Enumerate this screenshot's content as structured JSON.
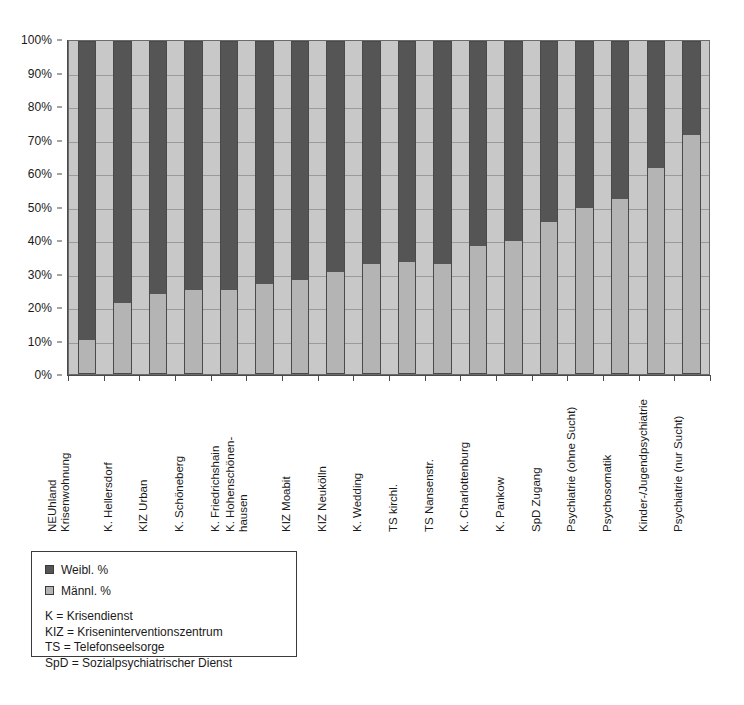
{
  "chart_data": {
    "type": "bar",
    "subtype": "stacked-percent",
    "title": "",
    "xlabel": "",
    "ylabel": "",
    "ylim": [
      0,
      100
    ],
    "grid": true,
    "legend_position": "below-left",
    "y_ticks": [
      "0%",
      "10%",
      "20%",
      "30%",
      "40%",
      "50%",
      "60%",
      "70%",
      "80%",
      "90%",
      "100%"
    ],
    "y_tick_values": [
      0,
      10,
      20,
      30,
      40,
      50,
      60,
      70,
      80,
      90,
      100
    ],
    "categories": [
      "NEUhland Krisenwohnung",
      "K. Hellersdorf",
      "KIZ Urban",
      "K. Schöneberg",
      "K. Friedrichshain",
      "K. Hohenschönen-hausen",
      "KIZ Moabit",
      "KIZ Neukölln",
      "K. Wedding",
      "TS kirchl.",
      "TS Nansenstr.",
      "K. Charlottenburg",
      "K. Pankow",
      "SpD Zugang",
      "Psychiatrie (ohne Sucht)",
      "Psychosomatik",
      "Kinder-/Jugendpsychiatrie",
      "Psychiatrie (nur Sucht)"
    ],
    "category_lines": [
      [
        "NEUhland",
        "Krisenwohnung"
      ],
      [
        "K. Hellersdorf"
      ],
      [
        "KIZ Urban"
      ],
      [
        "K. Schöneberg"
      ],
      [
        "K. Friedrichshain"
      ],
      [
        "K. Hohenschönen-",
        "hausen"
      ],
      [
        "KIZ Moabit"
      ],
      [
        "KIZ Neukölln"
      ],
      [
        "K. Wedding"
      ],
      [
        "TS kirchl."
      ],
      [
        "TS Nansenstr."
      ],
      [
        "K. Charlottenburg"
      ],
      [
        "K. Pankow"
      ],
      [
        "SpD Zugang"
      ],
      [
        "Psychiatrie (ohne Sucht)"
      ],
      [
        "Psychosomatik"
      ],
      [
        "Kinder-/Jugendpsychiatrie"
      ],
      [
        "Psychiatrie (nur Sucht)"
      ]
    ],
    "series": [
      {
        "name": "Männl. %",
        "color": "#b4b4b4",
        "values": [
          10,
          21,
          24,
          25,
          25,
          27,
          28,
          30.5,
          33,
          33.5,
          33,
          38.5,
          40,
          45.5,
          50,
          52.5,
          62,
          72
        ]
      },
      {
        "name": "Weibl. %",
        "color": "#555555",
        "values": [
          90,
          79,
          76,
          75,
          75,
          73,
          72,
          69.5,
          67,
          66.5,
          67,
          61.5,
          60,
          54.5,
          50,
          47.5,
          38,
          28
        ]
      }
    ]
  },
  "legend": {
    "entries": [
      {
        "label": "Weibl. %",
        "swatch": "#555555"
      },
      {
        "label": "Männl. %",
        "swatch": "#b4b4b4"
      }
    ],
    "notes": [
      "K = Krisendienst",
      "KIZ = Kriseninterventionszentrum",
      "TS = Telefonseelsorge",
      "SpD = Sozialpsychiatrischer Dienst"
    ]
  },
  "colors": {
    "weibl": "#555555",
    "maennl": "#b4b4b4",
    "plot_background": "#c8c8c8",
    "gridline": "#9a9a9a",
    "axis": "#4a4a4a"
  }
}
